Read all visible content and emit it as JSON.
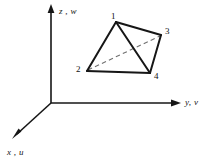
{
  "figure": {
    "kind": "3d-tetrahedron-coordinate-diagram",
    "background_color": "#ffffff",
    "ink_color": "#161616",
    "axes": {
      "origin": {
        "x": 51,
        "y": 103
      },
      "items": [
        {
          "id": "z",
          "label": "z , w",
          "direction": "up",
          "tip": {
            "x": 51,
            "y": 5
          }
        },
        {
          "id": "y",
          "label": "y, v",
          "direction": "right",
          "tip": {
            "x": 180,
            "y": 103
          }
        },
        {
          "id": "x",
          "label": "x , u",
          "direction": "down-left",
          "tip": {
            "x": 13,
            "y": 138
          }
        }
      ]
    },
    "tetrahedron": {
      "vertices": [
        {
          "id": "1",
          "label": "1",
          "x": 116,
          "y": 22
        },
        {
          "id": "2",
          "label": "2",
          "x": 87,
          "y": 71
        },
        {
          "id": "3",
          "label": "3",
          "x": 161,
          "y": 35
        },
        {
          "id": "4",
          "label": "4",
          "x": 150,
          "y": 73
        }
      ],
      "solid_edges": [
        [
          "1",
          "2"
        ],
        [
          "1",
          "3"
        ],
        [
          "1",
          "4"
        ],
        [
          "2",
          "4"
        ],
        [
          "3",
          "4"
        ]
      ],
      "hidden_edges": [
        [
          "2",
          "3"
        ]
      ]
    }
  }
}
